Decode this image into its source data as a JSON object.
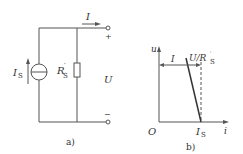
{
  "figure_a": {
    "caption": "a)",
    "current_label": "I",
    "source_label": "I",
    "source_sub": "S",
    "resistor_label": "R",
    "resistor_sup": "′",
    "resistor_sub": "S",
    "voltage_label": "U",
    "plus_sign": "+",
    "minus_sign": "−"
  },
  "figure_b": {
    "caption": "b)",
    "origin_label": "O",
    "y_axis_label": "u",
    "x_axis_label": "i",
    "current_label": "I",
    "branch_label": "U/R",
    "branch_sup": "′",
    "branch_sub": "S",
    "intercept_label": "I",
    "intercept_sub": "S"
  },
  "colors": {
    "line": "#555555",
    "text": "#333333"
  }
}
